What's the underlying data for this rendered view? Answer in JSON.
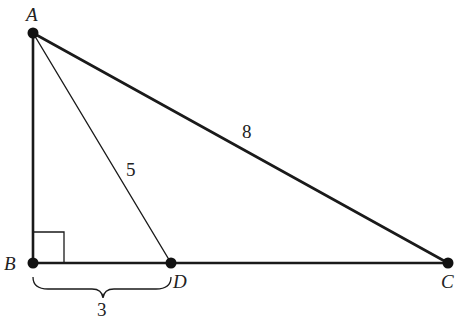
{
  "diagram": {
    "type": "right-triangle",
    "points": {
      "A": {
        "label": "A",
        "x": 33,
        "y": 33
      },
      "B": {
        "label": "B",
        "x": 33,
        "y": 263
      },
      "D": {
        "label": "D",
        "x": 171,
        "y": 263
      },
      "C": {
        "label": "C",
        "x": 448,
        "y": 263
      }
    },
    "segments": [
      {
        "from": "A",
        "to": "B",
        "weight": "thick"
      },
      {
        "from": "B",
        "to": "C",
        "weight": "thick"
      },
      {
        "from": "A",
        "to": "C",
        "weight": "thick",
        "length_label": "8"
      },
      {
        "from": "A",
        "to": "D",
        "weight": "thin",
        "length_label": "5"
      }
    ],
    "right_angle_at": "B",
    "brace": {
      "from": "B",
      "to": "D",
      "label": "3"
    },
    "labels": {
      "A": "A",
      "B": "B",
      "C": "C",
      "D": "D",
      "AC": "8",
      "AD": "5",
      "BD": "3"
    },
    "colors": {
      "line": "#1a1a1a",
      "point": "#111111",
      "text": "#222222",
      "background": "#ffffff"
    }
  }
}
